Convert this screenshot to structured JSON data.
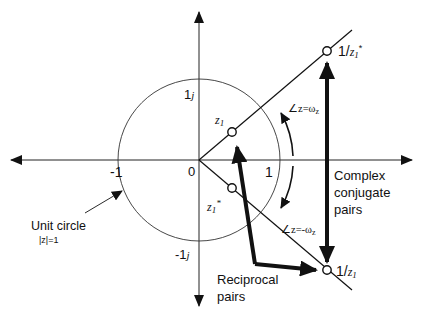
{
  "diagram": {
    "axes": {
      "origin_label": "0",
      "real_pos_tick": "1",
      "real_neg_tick": "-1",
      "imag_pos_tick": "1",
      "imag_pos_unit": "j",
      "imag_neg_tick": "-1",
      "imag_neg_unit": "j"
    },
    "unit_circle": {
      "label": "Unit circle",
      "equation": "|z|=1"
    },
    "points": {
      "z1": {
        "name": "z",
        "subscript": "1",
        "superscript": ""
      },
      "z1_conj": {
        "name": "z",
        "subscript": "1",
        "superscript": "*"
      },
      "inv_z1_conj": {
        "prefix": "1/",
        "name": "z",
        "subscript": "1",
        "superscript": "*"
      },
      "inv_z1": {
        "prefix": "1/",
        "name": "z",
        "subscript": "1",
        "superscript": ""
      }
    },
    "angles": {
      "upper": "∠z=ω",
      "upper_sub": "z",
      "lower": "∠z=-ω",
      "lower_sub": "z"
    },
    "annotations": {
      "complex_conjugate": [
        "Complex",
        "conjugate",
        "pairs"
      ],
      "reciprocal": [
        "Reciprocal",
        "pairs"
      ]
    },
    "colors": {
      "stroke": "#111111",
      "background": "#ffffff"
    }
  }
}
